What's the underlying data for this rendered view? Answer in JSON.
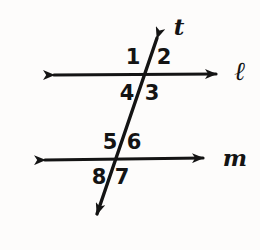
{
  "figure": {
    "background_color": "#fdfcfb",
    "stroke_color": "#141414",
    "width": 260,
    "height": 250
  },
  "lines": [
    {
      "id": "line-l",
      "label": "ℓ",
      "type": "double-arrow-horizontal",
      "label_x": 240,
      "label_y": 71,
      "x1": 43,
      "y1": 75,
      "x2": 227,
      "y2": 74
    },
    {
      "id": "line-m",
      "label": "m",
      "type": "double-arrow-horizontal",
      "label_x": 235,
      "label_y": 157,
      "x1": 34,
      "y1": 160,
      "x2": 214,
      "y2": 158
    },
    {
      "id": "line-t",
      "label": "t",
      "type": "double-arrow-transversal",
      "label_x": 179,
      "label_y": 26,
      "x1": 163,
      "y1": 21,
      "x2": 92,
      "y2": 229
    }
  ],
  "intersections": [
    {
      "id": "intersection-l-t",
      "x": 148,
      "y": 75
    },
    {
      "id": "intersection-m-t",
      "x": 119,
      "y": 159
    }
  ],
  "angle_labels": [
    {
      "id": "angle-1",
      "text": "1",
      "x": 133,
      "y": 57,
      "position": "upper-left-at-l"
    },
    {
      "id": "angle-2",
      "text": "2",
      "x": 164,
      "y": 57,
      "position": "upper-right-at-l"
    },
    {
      "id": "angle-3",
      "text": "3",
      "x": 152,
      "y": 93,
      "position": "lower-right-at-l"
    },
    {
      "id": "angle-4",
      "text": "4",
      "x": 127,
      "y": 93,
      "position": "lower-left-at-l"
    },
    {
      "id": "angle-5",
      "text": "5",
      "x": 110,
      "y": 142,
      "position": "upper-left-at-m"
    },
    {
      "id": "angle-6",
      "text": "6",
      "x": 134,
      "y": 142,
      "position": "upper-right-at-m"
    },
    {
      "id": "angle-7",
      "text": "7",
      "x": 122,
      "y": 177,
      "position": "lower-right-at-m"
    },
    {
      "id": "angle-8",
      "text": "8",
      "x": 99,
      "y": 177,
      "position": "lower-left-at-m"
    }
  ]
}
